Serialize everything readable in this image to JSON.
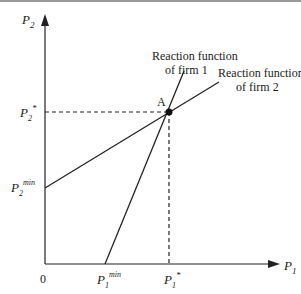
{
  "diagram": {
    "y_axis": {
      "label": "P",
      "sub": "2"
    },
    "x_axis": {
      "label": "P",
      "sub": "1"
    },
    "origin": "0",
    "p2_star": {
      "label": "P",
      "sub": "2",
      "sup": "*"
    },
    "p2_min": {
      "label": "P",
      "sub": "2",
      "sup": "min"
    },
    "p1_min": {
      "label": "P",
      "sub": "1",
      "sup": "min"
    },
    "p1_star": {
      "label": "P",
      "sub": "1",
      "sup": "*"
    },
    "point_label": "A",
    "rf1": {
      "line1": "Reaction function",
      "line2": "of firm 1"
    },
    "rf2": {
      "line1": "Reaction function",
      "line2": "of firm 2"
    },
    "colors": {
      "line": "#222222",
      "border": "#888888"
    }
  }
}
